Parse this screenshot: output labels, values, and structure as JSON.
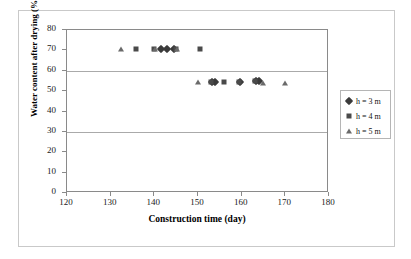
{
  "chart_data": {
    "type": "scatter",
    "title": "",
    "xlabel": "Construction time (day)",
    "ylabel": "Water content after drying (%)",
    "xlim": [
      120,
      180
    ],
    "ylim": [
      0,
      80
    ],
    "xticks": [
      120,
      130,
      140,
      150,
      160,
      170,
      180
    ],
    "yticks": [
      0,
      10,
      20,
      30,
      40,
      50,
      60,
      70,
      80
    ],
    "grid": "horizontal-major",
    "gridlines_y": [
      30,
      60
    ],
    "legend_position": "right-outside",
    "series": [
      {
        "name": "h = 3 m",
        "marker": "diamond",
        "color": "#3a3a3a",
        "points": [
          {
            "x": 141.5,
            "y": 70.5
          },
          {
            "x": 143.0,
            "y": 70.5
          },
          {
            "x": 144.6,
            "y": 70.5
          },
          {
            "x": 153.3,
            "y": 54.7
          },
          {
            "x": 154.0,
            "y": 54.7
          },
          {
            "x": 159.7,
            "y": 54.4
          },
          {
            "x": 163.2,
            "y": 54.9
          },
          {
            "x": 163.9,
            "y": 54.9
          }
        ]
      },
      {
        "name": "h = 4 m",
        "marker": "square",
        "color": "#4a4a4a",
        "points": [
          {
            "x": 135.8,
            "y": 70.5
          },
          {
            "x": 139.9,
            "y": 70.5
          },
          {
            "x": 144.9,
            "y": 70.5
          },
          {
            "x": 150.5,
            "y": 70.5
          },
          {
            "x": 153.0,
            "y": 54.7
          },
          {
            "x": 156.0,
            "y": 54.7
          },
          {
            "x": 159.4,
            "y": 54.4
          },
          {
            "x": 163.0,
            "y": 54.9
          }
        ]
      },
      {
        "name": "h = 5 m",
        "marker": "triangle",
        "color": "#6a6a6a",
        "points": [
          {
            "x": 132.3,
            "y": 70.5
          },
          {
            "x": 140.2,
            "y": 70.5
          },
          {
            "x": 145.2,
            "y": 70.5
          },
          {
            "x": 150.0,
            "y": 54.6
          },
          {
            "x": 164.9,
            "y": 54.2
          },
          {
            "x": 170.0,
            "y": 54.2
          }
        ]
      }
    ]
  },
  "legend": {
    "items": [
      {
        "label": "h = 3 m",
        "marker": "diamond"
      },
      {
        "label": "h = 4 m",
        "marker": "square"
      },
      {
        "label": "h = 5 m",
        "marker": "triangle"
      }
    ]
  }
}
